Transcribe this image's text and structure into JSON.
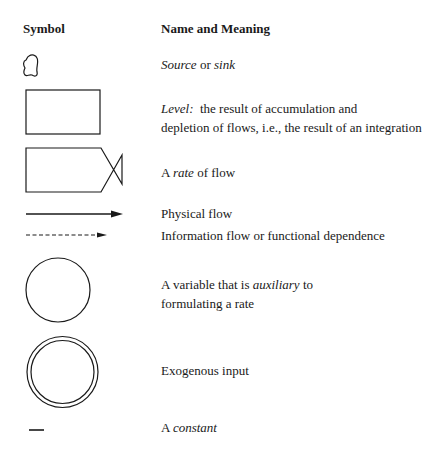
{
  "table": {
    "headers": {
      "symbol": "Symbol",
      "meaning": "Name and Meaning"
    },
    "rows": [
      {
        "symbol_icon": "cloud-source-sink-icon",
        "parts": [
          {
            "text": "Source",
            "italic": true
          },
          {
            "text": " or ",
            "italic": false
          },
          {
            "text": "sink",
            "italic": true
          }
        ]
      },
      {
        "symbol_icon": "rectangle-level-icon",
        "lead_italic": "Level:",
        "line1": "  the result of accumulation and",
        "line2": "depletion of flows, i.e., the result of an integration"
      },
      {
        "symbol_icon": "valve-rate-icon",
        "pre": "A ",
        "italic": "rate",
        "post": " of flow"
      },
      {
        "symbol_icon": "solid-arrow-icon",
        "text": "Physical flow"
      },
      {
        "symbol_icon": "dashed-arrow-icon",
        "text": "Information flow or functional dependence"
      },
      {
        "symbol_icon": "circle-auxiliary-icon",
        "pre": "A variable that is ",
        "italic": "auxiliary",
        "post": " to",
        "line2": "formulating a rate"
      },
      {
        "symbol_icon": "double-circle-exogenous-icon",
        "text": "Exogenous input"
      },
      {
        "symbol_icon": "dash-constant-icon",
        "pre": "A ",
        "italic": "constant"
      }
    ]
  },
  "colors": {
    "ink": "#1a1a1a",
    "background": "#ffffff"
  }
}
